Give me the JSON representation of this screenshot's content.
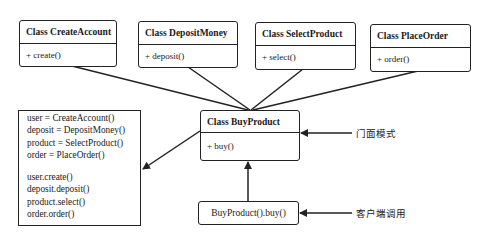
{
  "diagram": {
    "subsystems": [
      {
        "title": "Class CreateAccount",
        "method": "+ create()"
      },
      {
        "title": "Class DepositMoney",
        "method": "+ deposit()"
      },
      {
        "title": "Class SelectProduct",
        "method": "+ select()"
      },
      {
        "title": "Class PlaceOrder",
        "method": "+ order()"
      }
    ],
    "facade": {
      "title": "Class BuyProduct",
      "method": "+ buy()"
    },
    "facade_code": {
      "assignments": [
        "user = CreateAccount()",
        "deposit = DepositMoney()",
        "product = SelectProduct()",
        "order = PlaceOrder()"
      ],
      "calls": [
        "user.create()",
        "deposit.deposit()",
        "product.select()",
        "order.order()"
      ]
    },
    "client": {
      "label": "BuyProduct().buy()"
    },
    "annotations": {
      "facade_note": "门面模式",
      "client_note": "客户端调用"
    },
    "colors": {
      "line": "#222222",
      "background": "#ffffff"
    }
  }
}
